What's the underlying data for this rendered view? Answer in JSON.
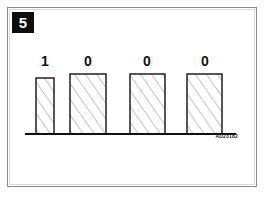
{
  "figure": {
    "badge_number": "5",
    "reference_code": "AD23182",
    "background_color": "#ffffff",
    "frame_color": "#8a8a8a",
    "badge_bg_color": "#0d0d0d",
    "badge_text_color": "#ffffff",
    "line_color": "#111111",
    "hatch_color": "#8c8c8c"
  },
  "chart_data": {
    "type": "bar",
    "title": "",
    "subtitle": "",
    "xlabel": "",
    "ylabel": "",
    "categories": [
      "1",
      "0",
      "0",
      "0"
    ],
    "values": [
      1,
      0,
      0,
      0
    ],
    "data_labels": [
      "1",
      "0",
      "0",
      "0"
    ],
    "legend": [],
    "legend_position": "none",
    "grid": false,
    "axis": {
      "baseline_only": true,
      "baseline_x_start": 25,
      "baseline_x_end": 236,
      "baseline_y": 134,
      "ticks": [],
      "tick_labels": []
    },
    "bars": [
      {
        "label": "1",
        "x": 36,
        "y": 78,
        "width": 18,
        "height": 56,
        "label_x": 45,
        "label_y": 54
      },
      {
        "label": "0",
        "x": 70,
        "y": 74,
        "width": 36,
        "height": 60,
        "label_x": 88,
        "label_y": 54
      },
      {
        "label": "0",
        "x": 130,
        "y": 74,
        "width": 35,
        "height": 60,
        "label_x": 147,
        "label_y": 54
      },
      {
        "label": "0",
        "x": 187,
        "y": 74,
        "width": 35,
        "height": 60,
        "label_x": 205,
        "label_y": 54
      }
    ],
    "annotations": [
      {
        "name": "reference-code",
        "text": "AD23182"
      }
    ]
  }
}
